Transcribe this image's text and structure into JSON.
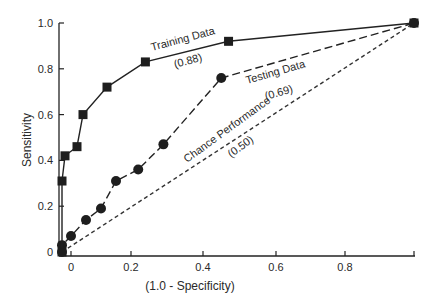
{
  "chart_data": {
    "type": "line",
    "title": "",
    "xlabel": "(1.0 - Specificity)",
    "ylabel": "Sensitivity",
    "xlim": [
      -0.04,
      1.0
    ],
    "ylim": [
      0,
      1.0
    ],
    "x_ticks": [
      0,
      0.2,
      0.4,
      0.6,
      0.8
    ],
    "x_tick_labels": [
      "0",
      "0.2",
      "0.4",
      "0.6",
      "0.8"
    ],
    "y_ticks": [
      0,
      0.2,
      0.4,
      0.6,
      0.8,
      1.0
    ],
    "y_tick_labels": [
      "0",
      "0.2",
      "0.4",
      "0.6",
      "0.8",
      "1.0"
    ],
    "grid": false,
    "legend": "none (inline annotations)",
    "series": [
      {
        "name": "Training Data",
        "auc_label": "(0.88)",
        "marker": "square",
        "line_style": "solid",
        "color": "#222222",
        "x": [
          -0.03,
          -0.03,
          -0.02,
          0.02,
          0.04,
          0.12,
          0.24,
          0.47,
          1.0
        ],
        "y": [
          0.0,
          0.31,
          0.42,
          0.46,
          0.6,
          0.72,
          0.83,
          0.92,
          1.0
        ]
      },
      {
        "name": "Testing Data",
        "auc_label": "(0.69)",
        "marker": "circle",
        "line_style": "dashed",
        "color": "#222222",
        "x": [
          -0.03,
          -0.03,
          0.0,
          0.05,
          0.1,
          0.15,
          0.22,
          0.29,
          0.45,
          1.0
        ],
        "y": [
          0.0,
          0.03,
          0.07,
          0.14,
          0.19,
          0.31,
          0.36,
          0.47,
          0.76,
          1.0
        ]
      },
      {
        "name": "Chance Performance",
        "auc_label": "(0.50)",
        "marker": "none",
        "line_style": "dotted-dash",
        "color": "#333333",
        "x": [
          -0.03,
          1.0
        ],
        "y": [
          0.0,
          1.0
        ]
      }
    ],
    "annotations": [
      {
        "text": "Training Data",
        "sub": "(0.88)"
      },
      {
        "text": "Testing Data",
        "sub": "(0.69)"
      },
      {
        "text": "Chance Performance",
        "sub": "(0.50)"
      }
    ]
  }
}
